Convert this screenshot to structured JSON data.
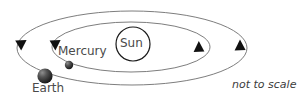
{
  "diagram": {
    "note": "not to scale",
    "bodies": {
      "sun": {
        "label": "Sun",
        "cx": 133,
        "cy": 44,
        "r": 17,
        "stroke": "#1a1a1a",
        "fill": "#ffffff"
      },
      "mercury": {
        "label": "Mercury",
        "cx": 69,
        "cy": 65,
        "r": 4.2,
        "color": "#2b2b2b"
      },
      "earth": {
        "label": "Earth",
        "cx": 45,
        "cy": 76,
        "r": 7.6,
        "color": "#2b2b2b"
      }
    },
    "orbits": [
      {
        "name": "mercury-orbit",
        "cx": 131,
        "cy": 47,
        "rx": 79,
        "ry": 25,
        "stroke": "#6e6e6e",
        "stroke_width": 0.9
      },
      {
        "name": "earth-orbit",
        "cx": 132,
        "cy": 48,
        "rx": 115,
        "ry": 37,
        "stroke": "#6e6e6e",
        "stroke_width": 0.9
      }
    ],
    "direction_arrows": [
      {
        "name": "earth-orbit-arrow-left",
        "x": 21,
        "y": 45,
        "direction": "down"
      },
      {
        "name": "mercury-orbit-arrow-left",
        "x": 55,
        "y": 45,
        "direction": "down"
      },
      {
        "name": "mercury-orbit-arrow-right",
        "x": 199,
        "y": 47,
        "direction": "up"
      },
      {
        "name": "earth-orbit-arrow-right",
        "x": 240,
        "y": 45,
        "direction": "up"
      }
    ]
  }
}
